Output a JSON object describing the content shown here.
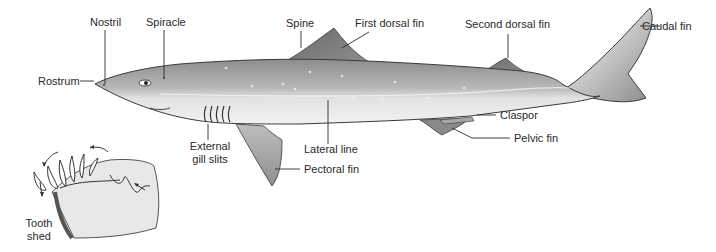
{
  "diagram": {
    "labels": {
      "nostril": "Nostril",
      "spiracle": "Spiracle",
      "spine": "Spine",
      "first_dorsal_fin": "First dorsal fin",
      "second_dorsal_fin": "Second dorsal fin",
      "caudal_fin": "Caudal fin",
      "rostrum": "Rostrum",
      "clasper": "Claspor",
      "pelvic_fin": "Pelvic fin",
      "lateral_line": "Lateral line",
      "pectoral_fin": "Pectoral fin",
      "external_gill_slits_1": "External",
      "external_gill_slits_2": "gill slits",
      "tooth_shed_1": "Tooth",
      "tooth_shed_2": "shed"
    },
    "inset": {
      "subject": "Tooth replacement in jaw"
    },
    "colors": {
      "body_dark": "#8a8a8a",
      "body_light": "#d9d9d9",
      "belly": "#efefef",
      "fin": "#7a7a7a",
      "outline": "#3a3a3a"
    }
  }
}
